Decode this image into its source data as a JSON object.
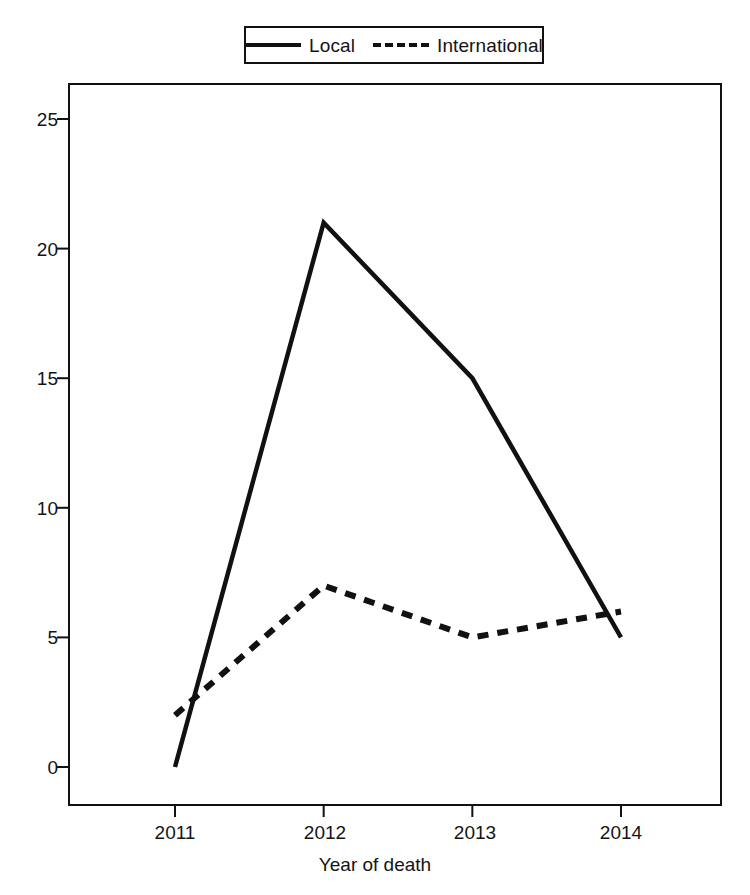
{
  "chart_data": {
    "type": "line",
    "title": "",
    "xlabel": "Year of death",
    "ylabel": "",
    "categories": [
      "2011",
      "2012",
      "2013",
      "2014"
    ],
    "x": [
      2011,
      2012,
      2013,
      2014
    ],
    "series": [
      {
        "name": "Local",
        "values": [
          0,
          21,
          15,
          5
        ],
        "style": "solid",
        "color": "#111111"
      },
      {
        "name": "International",
        "values": [
          2,
          7,
          5,
          6
        ],
        "style": "dashed",
        "color": "#111111"
      }
    ],
    "ylim": [
      0,
      26.5
    ],
    "yticks": [
      0,
      5,
      10,
      15,
      20,
      25
    ],
    "ytick_labels": [
      "0",
      "5",
      "10",
      "15",
      "20",
      "25"
    ],
    "xlim": [
      2010.5,
      2014.6
    ],
    "grid": false,
    "legend_position": "top-center",
    "legend_entries": [
      "Local",
      "International"
    ]
  },
  "legend": {
    "entries": [
      {
        "label": "Local",
        "style": "solid"
      },
      {
        "label": "International",
        "style": "dashed"
      }
    ]
  },
  "axes": {
    "x_title": "Year of death",
    "y_title": "",
    "y_tick_labels": [
      "25",
      "20",
      "15",
      "10",
      "5",
      "0"
    ],
    "x_tick_labels": [
      "2011",
      "2012",
      "2013",
      "2014"
    ]
  },
  "colors": {
    "line": "#111111",
    "frame": "#111111",
    "background": "#ffffff",
    "text": "#141414"
  }
}
